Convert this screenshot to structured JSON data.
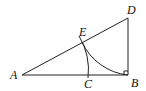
{
  "diagram": {
    "type": "geometry",
    "labels": {
      "A": "A",
      "B": "B",
      "C": "C",
      "D": "D",
      "E": "E"
    },
    "points": {
      "A": [
        22,
        75
      ],
      "B": [
        128,
        75
      ],
      "C": [
        88,
        75
      ],
      "D": [
        128,
        18
      ],
      "E": [
        82,
        42
      ]
    },
    "segments": [
      [
        "A",
        "B"
      ],
      [
        "B",
        "D"
      ],
      [
        "A",
        "D"
      ]
    ],
    "arcs": [
      {
        "center": "D",
        "from": "E",
        "to": "B"
      },
      {
        "center": "A",
        "through": "E",
        "to": "C"
      }
    ],
    "right_angle_at": "B",
    "colors": {
      "stroke": "#222222",
      "background": "#ffffff"
    }
  }
}
